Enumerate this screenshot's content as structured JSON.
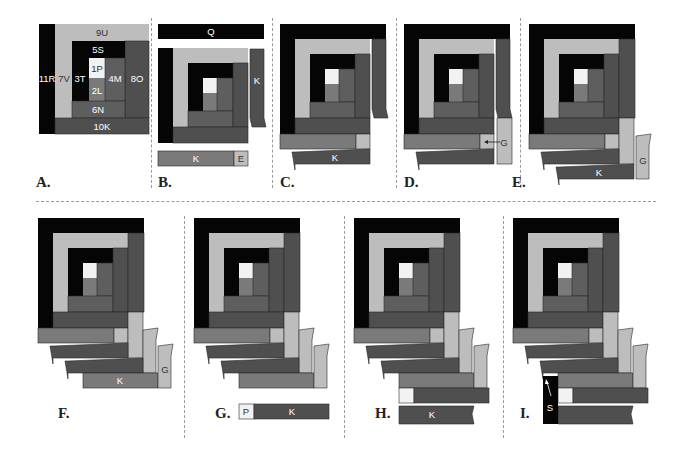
{
  "colors": {
    "black": "#050505",
    "light": "#bdbdbd",
    "white": "#f2f2f2",
    "medium": "#5e5e5e",
    "mediumdark": "#4f4f4f",
    "textured": "#7a7a7a",
    "dark": "#3a3a3a",
    "stroke": "#2a2a2a"
  },
  "panels": [
    {
      "id": "A",
      "label": "A.",
      "strips": {
        "p1": "1P",
        "l2": "2L",
        "t3": "3T",
        "m4": "4M",
        "s5": "5S",
        "n6": "6N",
        "v7": "7V",
        "o8": "8O",
        "u9": "9U",
        "k10": "10K",
        "r11": "11R"
      }
    },
    {
      "id": "B",
      "label": "B.",
      "strips": {
        "top_bar": "Q",
        "side_strip": "K",
        "bottom_k": "K",
        "bottom_e": "E"
      }
    },
    {
      "id": "C",
      "label": "C.",
      "strips": {
        "bottom_k": "K"
      }
    },
    {
      "id": "D",
      "label": "D.",
      "strips": {
        "arrow_g": "G"
      }
    },
    {
      "id": "E",
      "label": "E.",
      "strips": {
        "k": "K",
        "g": "G"
      }
    },
    {
      "id": "F",
      "label": "F.",
      "strips": {
        "k": "K",
        "g": "G"
      }
    },
    {
      "id": "G",
      "label": "G.",
      "strips": {
        "p": "P",
        "k": "K"
      }
    },
    {
      "id": "H",
      "label": "H.",
      "strips": {
        "k": "K"
      }
    },
    {
      "id": "I",
      "label": "I.",
      "strips": {
        "s": "S"
      }
    }
  ]
}
